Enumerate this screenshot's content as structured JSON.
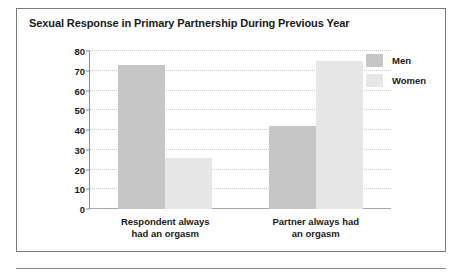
{
  "chart_data": {
    "type": "bar",
    "title": "Sexual Response in Primary Partnership During Previous Year",
    "categories": [
      "Respondent always had an orgasm",
      "Partner always had an orgasm"
    ],
    "category_lines": [
      [
        "Respondent always",
        "had an orgasm"
      ],
      [
        "Partner always had",
        "an orgasm"
      ]
    ],
    "series": [
      {
        "name": "Men",
        "values": [
          73,
          42
        ],
        "color": "#c6c6c6"
      },
      {
        "name": "Women",
        "values": [
          26,
          75
        ],
        "color": "#e6e6e6"
      }
    ],
    "xlabel": "",
    "ylabel": "",
    "ylim": [
      0,
      80
    ],
    "yticks": [
      0,
      10,
      20,
      30,
      40,
      50,
      60,
      70,
      80
    ],
    "ytick_labels": [
      "0",
      "10",
      "20",
      "30",
      "40",
      "50",
      "60",
      "70",
      "80"
    ],
    "grid": true,
    "grid_style": "dotted",
    "legend_position": "right"
  },
  "legend": {
    "items": [
      {
        "label": "Men"
      },
      {
        "label": "Women"
      }
    ]
  }
}
